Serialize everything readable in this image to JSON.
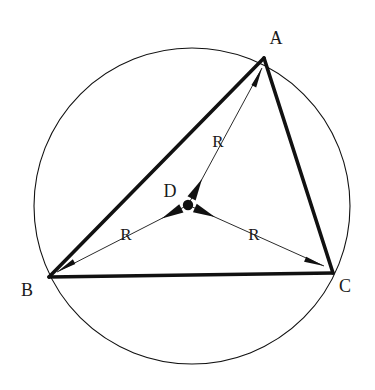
{
  "figure": {
    "background_color": "#ffffff",
    "stroke_color": "#111111",
    "thin_stroke_color": "#2b2b2b",
    "width": 375,
    "height": 390
  },
  "circle": {
    "name": "circumcircle",
    "center_x": 192,
    "center_y": 206,
    "radius": 158,
    "stroke_width": 1.1
  },
  "triangle": {
    "name": "triangle-ABC",
    "stroke_width": 3.6,
    "vertices": [
      {
        "id": "A",
        "label": "A",
        "x": 264,
        "y": 58,
        "label_x": 276,
        "label_y": 44
      },
      {
        "id": "B",
        "label": "B",
        "x": 49,
        "y": 277,
        "label_x": 27,
        "label_y": 296
      },
      {
        "id": "C",
        "label": "C",
        "x": 333,
        "y": 273,
        "label_x": 345,
        "label_y": 292
      }
    ],
    "edges": [
      {
        "name": "edge-AB",
        "from": "A",
        "to": "B"
      },
      {
        "name": "edge-BC",
        "from": "B",
        "to": "C"
      },
      {
        "name": "edge-CA",
        "from": "C",
        "to": "A"
      }
    ]
  },
  "center_point": {
    "id": "D",
    "label": "D",
    "x": 188,
    "y": 205,
    "dot_radius": 5.2,
    "label_x": 170,
    "label_y": 197
  },
  "radii": [
    {
      "name": "radius-D-to-A",
      "label": "R",
      "from_x": 188,
      "from_y": 205,
      "to_x": 262,
      "to_y": 68,
      "label_x": 218,
      "label_y": 147,
      "stroke_width": 1.0
    },
    {
      "name": "radius-D-to-B",
      "label": "R",
      "from_x": 188,
      "from_y": 205,
      "to_x": 57,
      "to_y": 272,
      "label_x": 126,
      "label_y": 240,
      "stroke_width": 1.0
    },
    {
      "name": "radius-D-to-C",
      "label": "R",
      "from_x": 188,
      "from_y": 205,
      "to_x": 324,
      "to_y": 266,
      "label_x": 254,
      "label_y": 240,
      "stroke_width": 1.0
    }
  ],
  "legend": {
    "radius_symbol": "R",
    "center_symbol": "D"
  }
}
